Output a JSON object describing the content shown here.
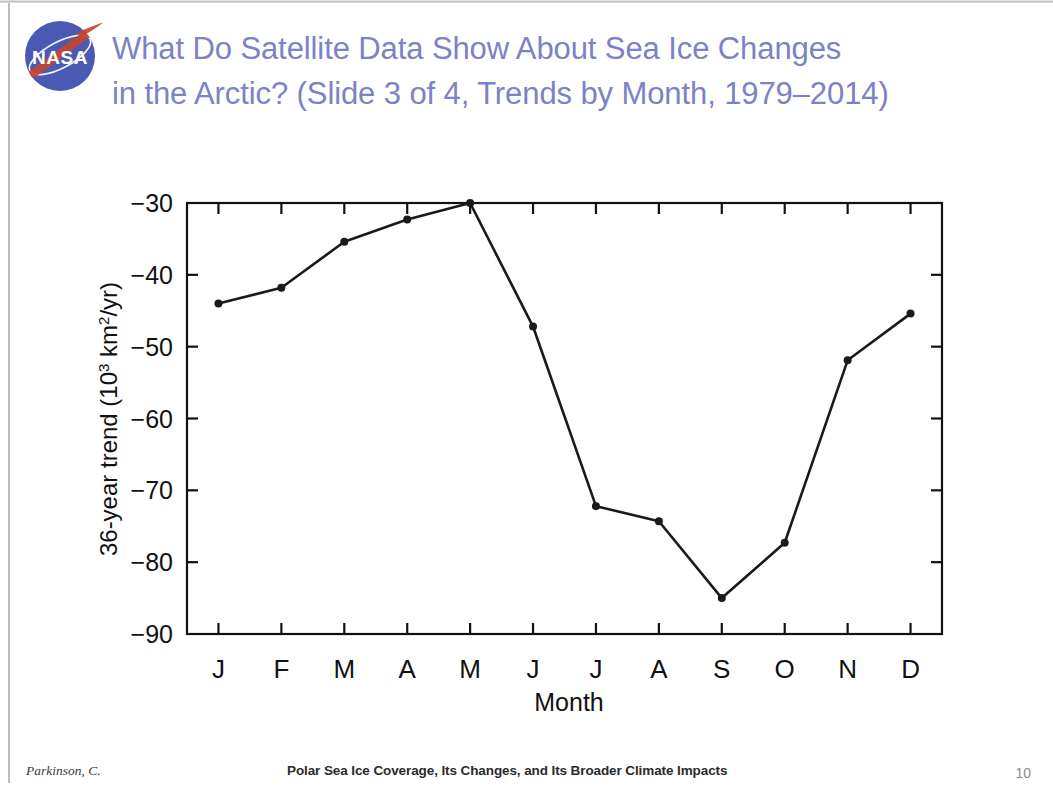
{
  "slide": {
    "logo_alt": "nasa-meatball-logo",
    "logo_wordmark": "NASA",
    "title_line1": "What Do Satellite Data Show About Sea Ice Changes",
    "title_line2": "in the Arctic? (Slide 3 of 4, Trends by Month, 1979–2014)",
    "title_color": "#7d81c6"
  },
  "footer": {
    "author": "Parkinson, C.",
    "center_title": "Polar Sea Ice Coverage, Its Changes, and Its Broader Climate Impacts",
    "page_number": "10"
  },
  "chart_data": {
    "type": "line",
    "title": "",
    "xlabel": "Month",
    "ylabel_parts": {
      "prefix": "36-year trend (10",
      "sup1": "3",
      "mid": " km",
      "sup2": "2",
      "suffix": "/yr)"
    },
    "ylabel": "36-year trend (10³ km²/yr)",
    "categories": [
      "J",
      "F",
      "M",
      "A",
      "M",
      "J",
      "J",
      "A",
      "S",
      "O",
      "N",
      "D"
    ],
    "category_names": [
      "January",
      "February",
      "March",
      "April",
      "May",
      "June",
      "July",
      "August",
      "September",
      "October",
      "November",
      "December"
    ],
    "values": [
      -44.0,
      -41.8,
      -35.4,
      -32.3,
      -30.0,
      -47.2,
      -72.2,
      -74.3,
      -85.0,
      -77.3,
      -51.9,
      -45.4
    ],
    "ylim": [
      -90,
      -30
    ],
    "yticks": [
      -30,
      -40,
      -50,
      -60,
      -70,
      -80,
      -90
    ],
    "ytick_labels": [
      "−30",
      "−40",
      "−50",
      "−60",
      "−70",
      "−80",
      "−90"
    ],
    "xlim": [
      0.5,
      12.5
    ],
    "grid": false,
    "legend": false,
    "series_color": "#1a1a1a",
    "marker": "circle",
    "marker_size": 4
  }
}
